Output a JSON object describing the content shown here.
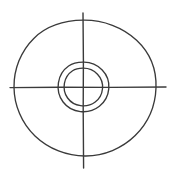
{
  "figure": {
    "canvas": {
      "width": 176,
      "height": 179,
      "background_color": "#ffffff"
    },
    "style": {
      "stroke_color": "#3a3a3a",
      "stroke_width": 1.3,
      "fill": "none",
      "appearance": "hand-drawn"
    },
    "center": {
      "x": 83,
      "y": 87
    },
    "circles": [
      {
        "name": "outer-circle",
        "label": "Outer circle",
        "radius_x": 68,
        "radius_y": 71,
        "left": 19,
        "right": 156,
        "top": 20,
        "bottom": 163
      },
      {
        "name": "middle-circle",
        "label": "Middle circle",
        "radius_x": 25,
        "radius_y": 25,
        "left": 58,
        "right": 108,
        "top": 62,
        "bottom": 112
      },
      {
        "name": "inner-circle",
        "label": "Inner circle",
        "radius_x": 19,
        "radius_y": 19,
        "left": 64,
        "right": 102,
        "top": 68,
        "bottom": 105
      }
    ],
    "axes": [
      {
        "name": "horizontal-axis-line",
        "label": "Horizontal axis",
        "orientation": "horizontal",
        "x1": 10,
        "y1": 87,
        "x2": 166,
        "y2": 87
      },
      {
        "name": "vertical-axis-line",
        "label": "Vertical axis",
        "orientation": "vertical",
        "x1": 83,
        "y1": 13,
        "x2": 83,
        "y2": 168
      }
    ]
  }
}
